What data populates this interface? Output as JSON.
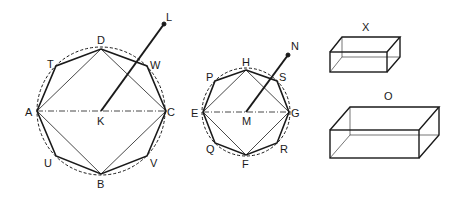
{
  "figure": {
    "left_circle": {
      "center_label": "K",
      "vertex_labels": {
        "top": "D",
        "bottom": "B",
        "left": "A",
        "right": "C"
      },
      "octagon_labels": [
        "T",
        "W",
        "U",
        "V"
      ],
      "pointer_label": "L"
    },
    "middle_circle": {
      "center_label": "M",
      "vertex_labels": {
        "top": "H",
        "bottom": "F",
        "left": "E",
        "right": "G"
      },
      "octagon_labels": [
        "P",
        "S",
        "Q",
        "R"
      ],
      "pointer_label": "N"
    },
    "boxes": [
      {
        "label": "X"
      },
      {
        "label": "O"
      }
    ]
  },
  "colors": {
    "line": "#1a1a1a",
    "background": "#ffffff"
  }
}
